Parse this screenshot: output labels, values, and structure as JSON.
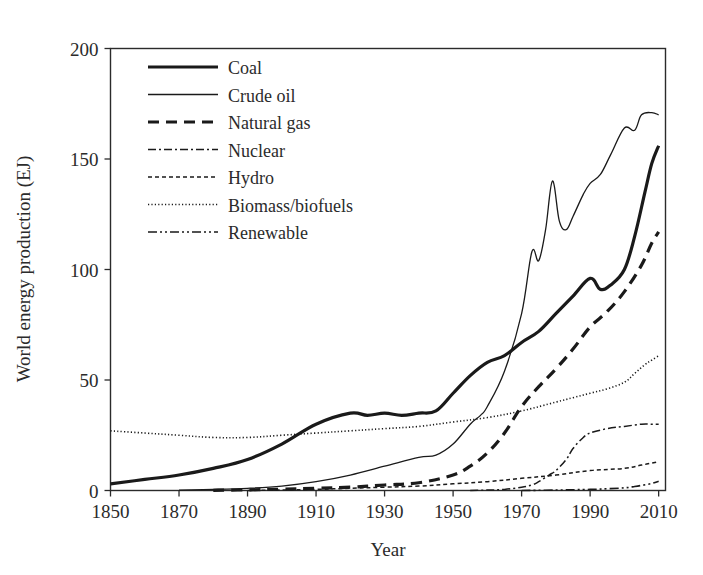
{
  "figure": {
    "background_color": "#ffffff",
    "ink_color": "#1a1a1a"
  },
  "chart_data": {
    "type": "line",
    "title": "",
    "xlabel": "Year",
    "ylabel": "World energy production (EJ)",
    "xlim": [
      1850,
      2012
    ],
    "ylim": [
      0,
      200
    ],
    "xticks": [
      1850,
      1870,
      1890,
      1910,
      1930,
      1950,
      1970,
      1990,
      2010
    ],
    "xtick_labels": [
      "1850",
      "1870",
      "1890",
      "1910",
      "1930",
      "1950",
      "1970",
      "1990",
      "2010"
    ],
    "yticks": [
      0,
      50,
      100,
      150,
      200
    ],
    "ytick_labels": [
      "0",
      "50",
      "100",
      "150",
      "200"
    ],
    "grid": false,
    "legend_position": "upper-left-inside",
    "series": [
      {
        "name": "Coal",
        "style": "solid-thick",
        "stroke_width": 3.2,
        "dasharray": "",
        "x": [
          1850,
          1860,
          1870,
          1880,
          1890,
          1900,
          1910,
          1920,
          1925,
          1930,
          1935,
          1940,
          1945,
          1950,
          1955,
          1960,
          1965,
          1970,
          1975,
          1980,
          1985,
          1990,
          1993,
          1996,
          2000,
          2003,
          2006,
          2008,
          2010
        ],
        "values": [
          3,
          5,
          7,
          10,
          14,
          21,
          30,
          35,
          34,
          35,
          34,
          35,
          36,
          44,
          52,
          58,
          61,
          67,
          72,
          80,
          88,
          96,
          91,
          93,
          100,
          115,
          135,
          148,
          156
        ]
      },
      {
        "name": "Crude oil",
        "style": "solid-thin",
        "stroke_width": 1.3,
        "dasharray": "",
        "x": [
          1870,
          1880,
          1890,
          1900,
          1910,
          1920,
          1930,
          1940,
          1945,
          1950,
          1955,
          1958,
          1960,
          1965,
          1970,
          1973,
          1975,
          1977,
          1979,
          1981,
          1983,
          1985,
          1988,
          1990,
          1993,
          1996,
          2000,
          2003,
          2005,
          2008,
          2010
        ],
        "values": [
          0.2,
          0.5,
          1,
          2,
          4,
          7,
          11,
          15,
          16,
          21,
          30,
          34,
          38,
          54,
          80,
          108,
          104,
          118,
          140,
          122,
          118,
          124,
          134,
          139,
          143,
          152,
          164,
          163,
          170,
          171,
          170
        ]
      },
      {
        "name": "Natural gas",
        "style": "dashed-thick",
        "stroke_width": 3.2,
        "dasharray": "11 7",
        "x": [
          1880,
          1890,
          1900,
          1910,
          1920,
          1930,
          1940,
          1950,
          1955,
          1960,
          1965,
          1970,
          1975,
          1980,
          1985,
          1990,
          1995,
          2000,
          2005,
          2008,
          2010
        ],
        "values": [
          0.1,
          0.3,
          0.6,
          1,
          1.5,
          2.5,
          3.5,
          7,
          11,
          17,
          26,
          38,
          47,
          55,
          64,
          74,
          81,
          90,
          102,
          112,
          117
        ]
      },
      {
        "name": "Nuclear",
        "style": "dashdot-thin",
        "stroke_width": 1.5,
        "dasharray": "8 3 2 3",
        "x": [
          1955,
          1960,
          1965,
          1970,
          1973,
          1975,
          1978,
          1980,
          1983,
          1985,
          1988,
          1990,
          1995,
          2000,
          2005,
          2008,
          2010
        ],
        "values": [
          0,
          0.2,
          0.5,
          1.5,
          2.5,
          4,
          7,
          9,
          14,
          19,
          24,
          26,
          28,
          29,
          30,
          30,
          30
        ]
      },
      {
        "name": "Hydro",
        "style": "dashed-thin",
        "stroke_width": 1.5,
        "dasharray": "4 3",
        "x": [
          1890,
          1900,
          1910,
          1920,
          1930,
          1940,
          1950,
          1960,
          1970,
          1980,
          1990,
          2000,
          2005,
          2010
        ],
        "values": [
          0,
          0.2,
          0.5,
          1,
          1.5,
          2,
          3,
          4,
          5.5,
          7,
          9,
          10,
          11.5,
          13
        ]
      },
      {
        "name": "Biomass/biofuels",
        "style": "dotted-fine",
        "stroke_width": 1.6,
        "dasharray": "1.2 2.2",
        "x": [
          1850,
          1860,
          1870,
          1880,
          1890,
          1900,
          1910,
          1920,
          1930,
          1940,
          1950,
          1960,
          1970,
          1980,
          1985,
          1990,
          1995,
          2000,
          2003,
          2006,
          2008,
          2010
        ],
        "values": [
          27,
          26,
          25,
          24,
          24,
          25,
          26,
          27,
          28,
          29,
          31,
          33,
          36,
          40,
          42,
          44,
          46,
          49,
          53,
          57,
          59,
          61
        ]
      },
      {
        "name": "Renewable",
        "style": "dashdotdot-thin",
        "stroke_width": 1.6,
        "dasharray": "9 3 2 3 2 3",
        "x": [
          1970,
          1980,
          1990,
          1995,
          2000,
          2003,
          2005,
          2008,
          2010
        ],
        "values": [
          0,
          0.2,
          0.5,
          0.8,
          1.2,
          1.8,
          2.3,
          3.2,
          4.2
        ]
      }
    ]
  },
  "legend": {
    "entries": [
      {
        "label": "Coal"
      },
      {
        "label": "Crude oil"
      },
      {
        "label": "Natural gas"
      },
      {
        "label": "Nuclear"
      },
      {
        "label": "Hydro"
      },
      {
        "label": "Biomass/biofuels"
      },
      {
        "label": "Renewable"
      }
    ]
  }
}
